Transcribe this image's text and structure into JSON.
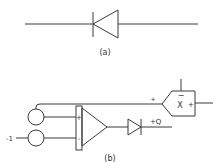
{
  "figure_a": {
    "label": "(a)",
    "component": "diode",
    "orientation": "cathode-left"
  },
  "figure_b": {
    "label": "(b)",
    "input_label": "-1",
    "output_label": "+Q",
    "opamp": {
      "plus": "+",
      "minus": "-"
    },
    "multiplier": {
      "symbol": "X",
      "top_sign": "−",
      "right_sign": "+",
      "input_sign": "+"
    }
  },
  "colors": {
    "stroke": "#3a3a3a",
    "background": "#ffffff"
  }
}
